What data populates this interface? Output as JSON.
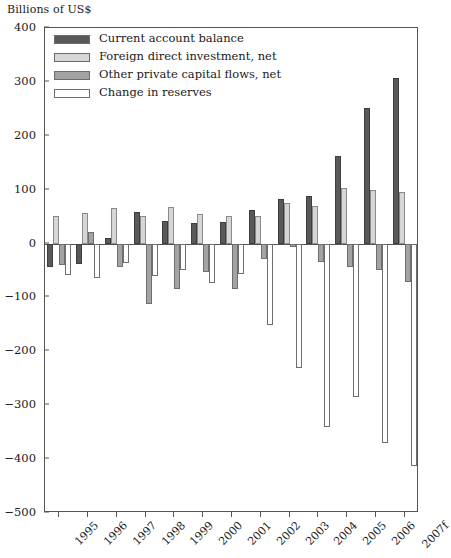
{
  "chart_data": {
    "type": "bar",
    "title": "",
    "ylabel": "Billions of US$",
    "xlabel": "",
    "ylim": [
      -500,
      400
    ],
    "ytick_values": [
      400,
      300,
      200,
      100,
      0,
      -100,
      -200,
      -300,
      -400,
      -500
    ],
    "ytick_labels": [
      "400",
      "300",
      "200",
      "100",
      "0",
      "−100",
      "−200",
      "−300",
      "−400",
      "−500"
    ],
    "grid": false,
    "legend_position": "upper-left",
    "categories": [
      "1995",
      "1996",
      "1997",
      "1998",
      "1999",
      "2000",
      "2001",
      "2002",
      "2003",
      "2004",
      "2005",
      "2006",
      "2007f"
    ],
    "series": [
      {
        "name": "Current account balance",
        "color": "#595959",
        "values": [
          -44,
          -38,
          10,
          58,
          41,
          39,
          40,
          62,
          82,
          88,
          163,
          252,
          308
        ]
      },
      {
        "name": "Foreign direct investment, net",
        "color": "#d6d6d6",
        "values": [
          52,
          57,
          66,
          52,
          67,
          54,
          52,
          51,
          76,
          70,
          104,
          100,
          96
        ]
      },
      {
        "name": "Other private capital flows, net",
        "color": "#a3a3a3",
        "values": [
          -40,
          22,
          -44,
          -112,
          -84,
          -52,
          -84,
          -28,
          -6,
          -34,
          -44,
          -50,
          -71
        ]
      },
      {
        "name": "Change in reserves",
        "color": "#ffffff",
        "values": [
          -58,
          -64,
          -36,
          -60,
          -49,
          -73,
          -56,
          -152,
          -231,
          -341,
          -285,
          -371,
          -412
        ]
      }
    ]
  },
  "legend": {
    "items": [
      {
        "label": "Current account balance",
        "swatch": "dark-gray-swatch"
      },
      {
        "label": "Foreign direct investment, net",
        "swatch": "light-gray-swatch"
      },
      {
        "label": "Other private capital flows, net",
        "swatch": "medium-gray-swatch"
      },
      {
        "label": "Change in reserves",
        "swatch": "white-swatch"
      }
    ]
  }
}
